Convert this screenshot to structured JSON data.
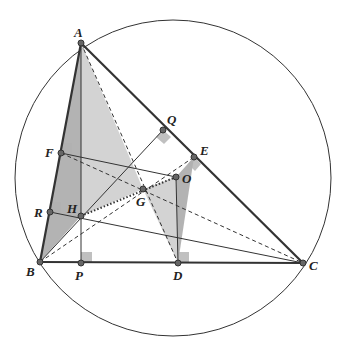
{
  "figure": {
    "colors": {
      "line": "#333333",
      "shade_light": "#c8c8c8",
      "shade_dark": "#9a9a9a",
      "right_angle_mark": "#b0b0b0",
      "point_fill": "#666666"
    },
    "points": [
      {
        "id": "A",
        "label": "A"
      },
      {
        "id": "B",
        "label": "B"
      },
      {
        "id": "C",
        "label": "C"
      },
      {
        "id": "D",
        "label": "D"
      },
      {
        "id": "E",
        "label": "E"
      },
      {
        "id": "F",
        "label": "F"
      },
      {
        "id": "G",
        "label": "G"
      },
      {
        "id": "H",
        "label": "H"
      },
      {
        "id": "O",
        "label": "O"
      },
      {
        "id": "P",
        "label": "P"
      },
      {
        "id": "Q",
        "label": "Q"
      },
      {
        "id": "R",
        "label": "R"
      }
    ]
  }
}
